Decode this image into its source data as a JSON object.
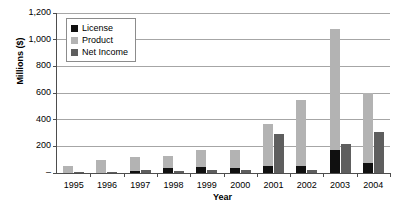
{
  "chart_data": {
    "type": "bar",
    "title": "",
    "xlabel": "Year",
    "ylabel": "Millions ($)",
    "categories": [
      "1995",
      "1996",
      "1997",
      "1998",
      "1999",
      "2000",
      "2001",
      "2002",
      "2003",
      "2004"
    ],
    "series": [
      {
        "name": "License",
        "color": "#101010",
        "values": [
          0,
          0,
          15,
          38,
          42,
          38,
          55,
          55,
          175,
          75
        ]
      },
      {
        "name": "Product",
        "color": "#b3b3b3",
        "values": [
          50,
          95,
          120,
          130,
          175,
          175,
          370,
          545,
          1080,
          600
        ]
      },
      {
        "name": "Net Income",
        "color": "#5e5e5e",
        "values": [
          8,
          10,
          20,
          14,
          25,
          20,
          295,
          25,
          215,
          305
        ]
      }
    ],
    "ylim": [
      0,
      1200
    ],
    "yticks": [
      0,
      200,
      400,
      600,
      800,
      1000,
      1200
    ],
    "ytick_labels": [
      "–",
      "200",
      "400",
      "600",
      "800",
      "1,000",
      "1,200"
    ],
    "grid": true,
    "legend_position": "upper-left-inside",
    "bar_grouping": "overlapped-pairs"
  },
  "legend": {
    "items": [
      {
        "label": "License",
        "swatch": "#101010"
      },
      {
        "label": "Product",
        "swatch": "#b3b3b3"
      },
      {
        "label": "Net Income",
        "swatch": "#5e5e5e"
      }
    ]
  },
  "axes": {
    "y_title": "Millions ($)",
    "x_title": "Year"
  }
}
